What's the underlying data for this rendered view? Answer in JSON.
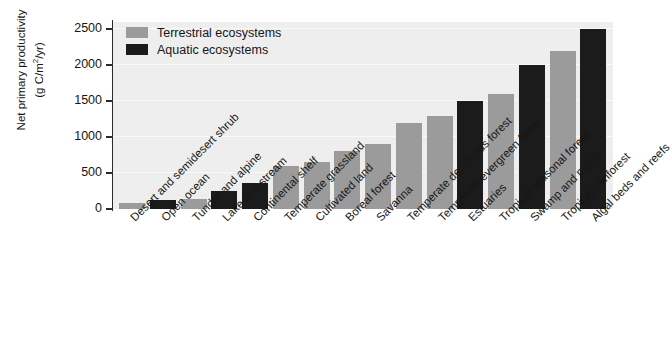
{
  "chart_data": {
    "type": "bar",
    "title": "",
    "xlabel": "",
    "ylabel": "Net primary productivity (g C/m²/yr)",
    "ylabel_line1": "Net primary productivity",
    "ylabel_line2_pre": "(g C/m",
    "ylabel_line2_sup": "2",
    "ylabel_line2_post": "/yr)",
    "ylim": [
      0,
      2600
    ],
    "yticks": [
      0,
      500,
      1000,
      1500,
      2000,
      2500
    ],
    "ytick_labels": [
      "0",
      "500",
      "1000",
      "1500",
      "2000",
      "2500"
    ],
    "grid": true,
    "legend_position": "top-left",
    "categories": [
      "Desert and semidesert shrub",
      "Open ocean",
      "Tundra and alpine",
      "Lake and stream",
      "Continental shelf",
      "Temperate grassland",
      "Cultivated land",
      "Boreal forest",
      "Savanna",
      "Temperate deciduous forest",
      "Temperate evergreen forest",
      "Estuaries",
      "Tropical seasonal forest",
      "Swamp and marsh",
      "Tropical rainforest",
      "Algal beds and reefs"
    ],
    "values": [
      90,
      125,
      140,
      250,
      360,
      600,
      650,
      800,
      900,
      1200,
      1300,
      1500,
      1600,
      2000,
      2200,
      2500
    ],
    "groups": [
      "terrestrial",
      "aquatic",
      "terrestrial",
      "aquatic",
      "aquatic",
      "terrestrial",
      "terrestrial",
      "terrestrial",
      "terrestrial",
      "terrestrial",
      "terrestrial",
      "aquatic",
      "terrestrial",
      "aquatic",
      "terrestrial",
      "aquatic"
    ],
    "legend": [
      {
        "key": "terrestrial",
        "label": "Terrestrial ecosystems",
        "color": "#9b9b9b"
      },
      {
        "key": "aquatic",
        "label": "Aquatic ecosystems",
        "color": "#1b1b1b"
      }
    ],
    "colors": {
      "terrestrial": "#9b9b9b",
      "aquatic": "#1b1b1b",
      "plot_background": "#eeeeee",
      "gridline": "#f9f9f9",
      "axis": "#2b2b2b",
      "text": "#161616"
    }
  }
}
